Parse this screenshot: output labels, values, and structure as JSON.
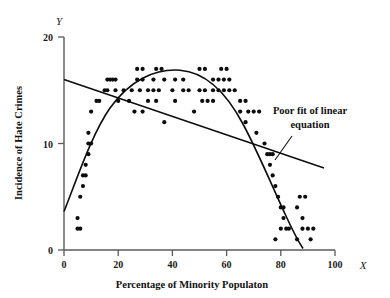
{
  "figure": {
    "background": "#ffffff",
    "point_color": "#0d0d0d",
    "axis_color": "#5a5a5a",
    "line_color": "#0d0d0d"
  },
  "axes": {
    "x_variable": "X",
    "y_variable": "Y",
    "x_title": "Percentage of Minority Populaton",
    "y_title": "Incidence of Hate Crimes",
    "x_ticks": [
      "0",
      "20",
      "40",
      "60",
      "80",
      "100"
    ],
    "y_ticks": [
      "0",
      "10",
      "20"
    ]
  },
  "annotation": {
    "line1": "Poor fit of linear",
    "line2": "equation"
  },
  "chart_data": {
    "type": "scatter",
    "title": "",
    "xlabel": "Percentage of Minority Populaton",
    "ylabel": "Incidence of Hate Crimes",
    "xlim": [
      0,
      100
    ],
    "ylim": [
      0,
      20
    ],
    "xticks": [
      0,
      20,
      40,
      60,
      80,
      100
    ],
    "yticks": [
      0,
      10,
      20
    ],
    "grid": false,
    "legend": "none",
    "annotations": [
      {
        "text": "Poor fit of linear equation",
        "x": 88,
        "y": 12.2,
        "leader_from": [
          84,
          10.8
        ],
        "leader_to": [
          78,
          9.2
        ]
      }
    ],
    "points": [
      [
        5,
        2
      ],
      [
        6,
        2
      ],
      [
        5,
        3
      ],
      [
        6,
        5
      ],
      [
        7,
        6
      ],
      [
        7,
        7
      ],
      [
        8,
        7
      ],
      [
        8,
        8
      ],
      [
        9,
        9
      ],
      [
        9,
        10
      ],
      [
        10,
        10
      ],
      [
        9,
        11
      ],
      [
        10,
        13
      ],
      [
        12,
        14
      ],
      [
        13,
        14
      ],
      [
        15,
        15
      ],
      [
        16,
        15
      ],
      [
        16,
        16
      ],
      [
        17,
        16
      ],
      [
        18,
        16
      ],
      [
        19,
        16
      ],
      [
        19,
        15
      ],
      [
        22,
        15
      ],
      [
        25,
        15
      ],
      [
        20,
        14
      ],
      [
        27,
        17
      ],
      [
        29,
        17
      ],
      [
        27,
        16
      ],
      [
        29,
        16
      ],
      [
        28,
        15
      ],
      [
        31,
        15
      ],
      [
        26,
        13
      ],
      [
        24,
        14
      ],
      [
        34,
        17
      ],
      [
        36,
        17
      ],
      [
        33,
        16
      ],
      [
        37,
        16
      ],
      [
        33,
        15
      ],
      [
        35,
        15
      ],
      [
        31,
        14
      ],
      [
        34,
        14
      ],
      [
        29,
        13
      ],
      [
        37,
        12
      ],
      [
        41,
        16
      ],
      [
        44,
        16
      ],
      [
        40,
        15
      ],
      [
        44,
        15
      ],
      [
        41,
        14
      ],
      [
        46,
        15
      ],
      [
        50,
        17
      ],
      [
        52,
        17
      ],
      [
        50,
        15
      ],
      [
        52,
        15
      ],
      [
        48,
        13
      ],
      [
        55,
        16
      ],
      [
        57,
        16
      ],
      [
        55,
        15
      ],
      [
        57,
        15
      ],
      [
        53,
        14
      ],
      [
        55,
        14
      ],
      [
        51,
        14
      ],
      [
        58,
        17
      ],
      [
        60,
        17
      ],
      [
        59,
        16
      ],
      [
        61,
        16
      ],
      [
        59,
        15
      ],
      [
        61,
        15
      ],
      [
        63,
        15
      ],
      [
        65,
        14
      ],
      [
        67,
        14
      ],
      [
        65,
        13
      ],
      [
        68,
        13
      ],
      [
        70,
        13
      ],
      [
        72,
        13
      ],
      [
        67,
        12
      ],
      [
        71,
        11
      ],
      [
        74,
        10
      ],
      [
        75,
        9
      ],
      [
        76,
        9
      ],
      [
        77,
        9
      ],
      [
        76,
        8
      ],
      [
        77,
        7
      ],
      [
        78,
        6
      ],
      [
        79,
        5
      ],
      [
        87,
        5
      ],
      [
        89,
        5
      ],
      [
        80,
        4
      ],
      [
        81,
        4
      ],
      [
        86,
        4
      ],
      [
        81,
        3
      ],
      [
        88,
        3
      ],
      [
        80,
        2
      ],
      [
        82,
        2
      ],
      [
        83,
        2
      ],
      [
        88,
        2
      ],
      [
        90,
        2
      ],
      [
        92,
        2
      ],
      [
        78,
        1
      ],
      [
        86,
        1
      ],
      [
        91,
        1
      ]
    ],
    "linear_fit": {
      "label": "linear equation (poor fit)",
      "x_start": 0,
      "y_start": 16.0,
      "x_end": 96,
      "y_end": 7.7,
      "slope": -0.0865,
      "intercept": 16.0
    },
    "quadratic_fit": {
      "label": "quadratic (curvilinear) fit",
      "vertex_x": 43,
      "vertex_y": 16.8,
      "y_at_x0": 3.6,
      "y_at_x90": 0.2
    }
  }
}
